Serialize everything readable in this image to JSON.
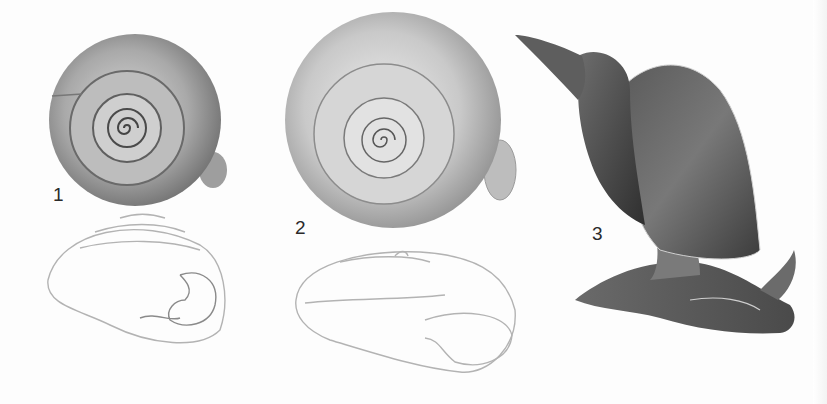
{
  "plate": {
    "background": "#fdfdfd",
    "figures": [
      {
        "id": 1,
        "label": "1",
        "views": [
          "apical-shaded",
          "apertural-outline"
        ]
      },
      {
        "id": 2,
        "label": "2",
        "views": [
          "apical-shaded",
          "apertural-outline"
        ]
      },
      {
        "id": 3,
        "label": "3",
        "views": [
          "live-animal-lateral"
        ]
      }
    ]
  }
}
